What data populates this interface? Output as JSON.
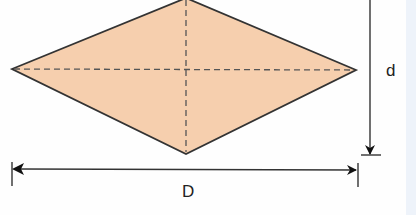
{
  "diagram": {
    "shape": "rhombus",
    "fill_color": "#f6cfae",
    "stroke_color": "#333333",
    "labels": {
      "long_diagonal": "D",
      "short_diagonal": "d"
    }
  }
}
